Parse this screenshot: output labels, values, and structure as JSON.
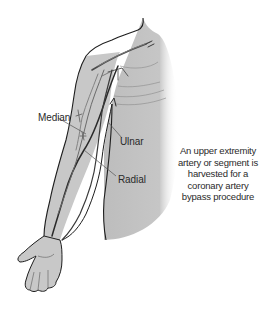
{
  "figure": {
    "type": "anatomical-illustration",
    "colors": {
      "skin_fill": "#c8c8c8",
      "shadow_fill": "#b4b4b4",
      "outline": "#1e1e1e",
      "artery_dark": "#2e2e2e",
      "artery_light": "#6a6a6a",
      "background": "#ffffff"
    }
  },
  "labels": {
    "median": "Median",
    "ulnar": "Ulnar",
    "radial": "Radial"
  },
  "caption": {
    "lines": [
      "An upper extremity",
      "artery or segment is",
      "harvested for a",
      "coronary artery",
      "bypass procedure"
    ]
  }
}
